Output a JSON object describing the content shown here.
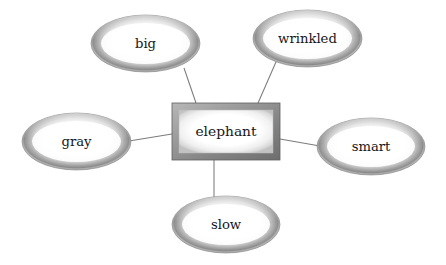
{
  "diagram": {
    "type": "word-web",
    "title": "",
    "background_color": "#ffffff",
    "center": {
      "label": "elephant",
      "shape": "rectangle",
      "x": 172,
      "y": 103,
      "width": 108,
      "height": 57,
      "fill_color": "#ffffff",
      "border_color": "#8f8f8f",
      "text_color": "#16161a"
    },
    "nodes": [
      {
        "id": "big",
        "label": "big",
        "shape": "ellipse",
        "cx": 145.5,
        "cy": 43.5,
        "rx": 54.5,
        "ry": 28.5,
        "fill_color": "#ffffff",
        "ring_color": "#8a8a8a",
        "text_color": "#16161a"
      },
      {
        "id": "wrinkled",
        "label": "wrinkled",
        "shape": "ellipse",
        "cx": 307.5,
        "cy": 38.5,
        "rx": 54.5,
        "ry": 28.5,
        "fill_color": "#ffffff",
        "ring_color": "#8a8a8a",
        "text_color": "#16161a"
      },
      {
        "id": "gray",
        "label": "gray",
        "shape": "ellipse",
        "cx": 76.5,
        "cy": 141.5,
        "rx": 54.5,
        "ry": 28.5,
        "fill_color": "#ffffff",
        "ring_color": "#8a8a8a",
        "text_color": "#16161a"
      },
      {
        "id": "smart",
        "label": "smart",
        "shape": "ellipse",
        "cx": 371,
        "cy": 146.5,
        "rx": 54,
        "ry": 28.5,
        "fill_color": "#ffffff",
        "ring_color": "#8a8a8a",
        "text_color": "#16161a"
      },
      {
        "id": "slow",
        "label": "slow",
        "shape": "ellipse",
        "cx": 226,
        "cy": 224.5,
        "rx": 54,
        "ry": 28.5,
        "fill_color": "#ffffff",
        "ring_color": "#8a8a8a",
        "text_color": "#16161a"
      }
    ],
    "connectors": [
      {
        "id": "center-to-big",
        "from": "elephant",
        "to": "big",
        "x1": 196,
        "y1": 103,
        "x2": 184,
        "y2": 68,
        "color": "#7c7c7c"
      },
      {
        "id": "center-to-wrinkled",
        "from": "elephant",
        "to": "wrinkled",
        "x1": 258,
        "y1": 103,
        "x2": 276,
        "y2": 62,
        "color": "#7c7c7c"
      },
      {
        "id": "center-to-gray",
        "from": "elephant",
        "to": "gray",
        "x1": 172,
        "y1": 134,
        "x2": 129,
        "y2": 141,
        "color": "#7c7c7c"
      },
      {
        "id": "center-to-smart",
        "from": "elephant",
        "to": "smart",
        "x1": 280,
        "y1": 139,
        "x2": 320,
        "y2": 146,
        "color": "#7c7c7c"
      },
      {
        "id": "center-to-slow",
        "from": "elephant",
        "to": "slow",
        "x1": 214,
        "y1": 160,
        "x2": 214,
        "y2": 198,
        "color": "#7c7c7c"
      }
    ]
  }
}
